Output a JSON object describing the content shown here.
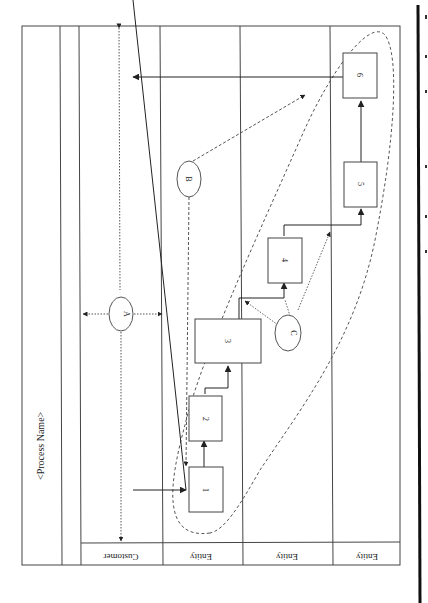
{
  "diagram": {
    "title": "<Process Name>",
    "orientation": "rotated-90-clockwise",
    "lanes": [
      {
        "label": "Customer"
      },
      {
        "label": "Entity"
      },
      {
        "label": "Entity"
      },
      {
        "label": "Entity"
      }
    ],
    "steps": [
      {
        "id": "1",
        "label": "1"
      },
      {
        "id": "2",
        "label": "2"
      },
      {
        "id": "3",
        "label": "3"
      },
      {
        "id": "4",
        "label": "4"
      },
      {
        "id": "5",
        "label": "5"
      },
      {
        "id": "6",
        "label": "6"
      }
    ],
    "callouts": [
      {
        "id": "A",
        "label": "A"
      },
      {
        "id": "B",
        "label": "B"
      },
      {
        "id": "C",
        "label": "C"
      }
    ]
  },
  "colors": {
    "line": "#333333",
    "dashed": "#555555",
    "background": "#ffffff"
  }
}
